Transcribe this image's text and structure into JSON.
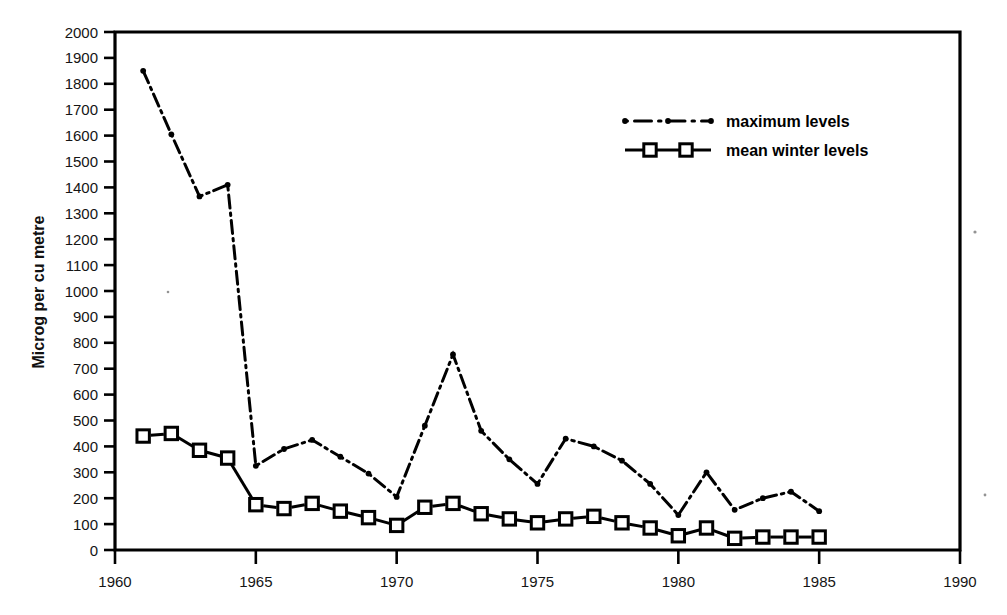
{
  "chart_data": {
    "type": "line",
    "title": "",
    "subtitle": "",
    "xlabel": "",
    "ylabel": "Microg per cu metre",
    "xlim": [
      1960,
      1990
    ],
    "ylim": [
      0,
      2000
    ],
    "x_ticks_major": [
      1960,
      1965,
      1970,
      1975,
      1980,
      1985,
      1990
    ],
    "x_tick_labels": [
      "1960",
      "1965",
      "1970",
      "1975",
      "1980",
      "1985",
      "1990"
    ],
    "y_ticks": [
      0,
      100,
      200,
      300,
      400,
      500,
      600,
      700,
      800,
      900,
      1000,
      1100,
      1200,
      1300,
      1400,
      1500,
      1600,
      1700,
      1800,
      1900,
      2000
    ],
    "y_tick_labels": [
      "0",
      "100",
      "200",
      "300",
      "400",
      "500",
      "600",
      "700",
      "800",
      "900",
      "1000",
      "1100",
      "1200",
      "1300",
      "1400",
      "1500",
      "1600",
      "1700",
      "1800",
      "1900",
      "2000"
    ],
    "grid": false,
    "legend_position": "upper-center-right",
    "series": [
      {
        "name": "maximum levels",
        "style": "dash-dot",
        "marker": "dot",
        "color": "#000000",
        "x": [
          1961,
          1962,
          1963,
          1964,
          1965,
          1966,
          1967,
          1968,
          1969,
          1970,
          1971,
          1972,
          1973,
          1974,
          1975,
          1976,
          1977,
          1978,
          1979,
          1980,
          1981,
          1982,
          1983,
          1984,
          1985
        ],
        "values": [
          1850,
          1605,
          1365,
          1410,
          325,
          390,
          425,
          360,
          295,
          205,
          480,
          755,
          460,
          350,
          255,
          430,
          400,
          345,
          255,
          135,
          300,
          155,
          200,
          225,
          150
        ]
      },
      {
        "name": "mean winter levels",
        "style": "dashed",
        "marker": "open-square",
        "color": "#000000",
        "x": [
          1961,
          1962,
          1963,
          1964,
          1965,
          1966,
          1967,
          1968,
          1969,
          1970,
          1971,
          1972,
          1973,
          1974,
          1975,
          1976,
          1977,
          1978,
          1979,
          1980,
          1981,
          1982,
          1983,
          1984,
          1985
        ],
        "values": [
          440,
          450,
          385,
          355,
          175,
          160,
          180,
          150,
          125,
          95,
          165,
          180,
          140,
          120,
          105,
          120,
          130,
          105,
          85,
          55,
          85,
          45,
          50,
          50,
          50
        ]
      }
    ]
  },
  "legend": {
    "items": [
      {
        "label": "maximum levels"
      },
      {
        "label": "mean winter levels"
      }
    ]
  }
}
